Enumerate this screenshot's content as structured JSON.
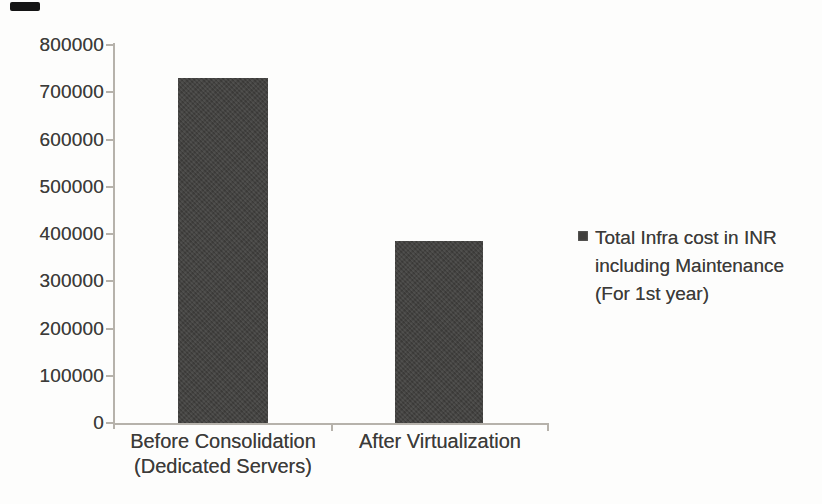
{
  "chart_data": {
    "type": "bar",
    "categories": [
      "Before Consolidation (Dedicated Servers)",
      "After Virtualization"
    ],
    "category_lines": [
      [
        "Before Consolidation",
        "(Dedicated Servers)"
      ],
      [
        "After Virtualization"
      ]
    ],
    "values": [
      730000,
      385000
    ],
    "series": [
      {
        "name": "Total Infra cost in INR including Maintenance (For 1st year)",
        "values": [
          730000,
          385000
        ]
      }
    ],
    "title": "",
    "xlabel": "",
    "ylabel": "",
    "ylim": [
      0,
      800000
    ],
    "ytick_step": 100000,
    "yticks": [
      "800000",
      "700000",
      "600000",
      "500000",
      "400000",
      "300000",
      "200000",
      "100000",
      "0"
    ],
    "grid": false,
    "legend_position": "right",
    "bar_color": "#403f3d",
    "axis_color": "#b6b2ab",
    "text_color": "#3c3b39"
  },
  "legend": {
    "lines": [
      "Total Infra cost in INR",
      "including Maintenance",
      "(For 1st year)"
    ],
    "marker": "filled-square"
  },
  "artifact_color": "#141414"
}
